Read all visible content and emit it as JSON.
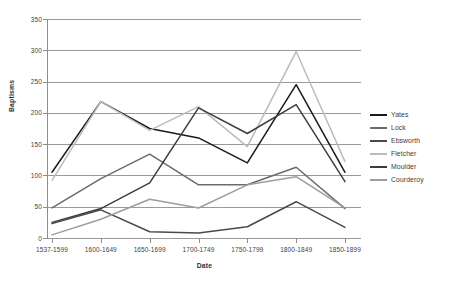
{
  "chart_data": {
    "type": "line",
    "title": "",
    "xlabel": "Date",
    "ylabel": "Baptisms",
    "categories": [
      "1537-1599",
      "1600-1649",
      "1650-1699",
      "1700-1749",
      "1750-1799",
      "1800-1849",
      "1850-1899"
    ],
    "ylim": [
      0,
      350
    ],
    "yticks": [
      0,
      50,
      100,
      150,
      200,
      250,
      300,
      350
    ],
    "grid": true,
    "legend_position": "right",
    "series": [
      {
        "name": "Yates",
        "color": "#1a1a1a",
        "values": [
          105,
          218,
          175,
          160,
          120,
          245,
          105
        ]
      },
      {
        "name": "Lock",
        "color": "#6b6b6b",
        "values": [
          48,
          95,
          134,
          85,
          85,
          113,
          47
        ]
      },
      {
        "name": "Ebsworth",
        "color": "#4a4a4a",
        "values": [
          23,
          45,
          10,
          8,
          18,
          58,
          17
        ]
      },
      {
        "name": "Fletcher",
        "color": "#bcbcbc",
        "values": [
          92,
          218,
          172,
          210,
          146,
          298,
          122
        ]
      },
      {
        "name": "Moulder",
        "color": "#3d3d3d",
        "values": [
          25,
          47,
          88,
          208,
          167,
          213,
          90
        ]
      },
      {
        "name": "Courderoy",
        "color": "#9d9d9d",
        "values": [
          5,
          30,
          62,
          48,
          85,
          98,
          48
        ]
      }
    ]
  },
  "legend": {
    "items": [
      {
        "label": "Yates"
      },
      {
        "label": "Lock"
      },
      {
        "label": "Ebsworth"
      },
      {
        "label": "Fletcher"
      },
      {
        "label": "Moulder"
      },
      {
        "label": "Courderoy"
      }
    ]
  },
  "axes": {
    "y_title": "Baptisms",
    "x_title": "Date",
    "y_tick_labels": [
      "0",
      "50",
      "100",
      "150",
      "200",
      "250",
      "300",
      "350"
    ],
    "x_tick_labels": [
      "1537-1599",
      "1600-1649",
      "1650-1699",
      "1700-1749",
      "1750-1799",
      "1800-1849",
      "1850-1899"
    ]
  }
}
